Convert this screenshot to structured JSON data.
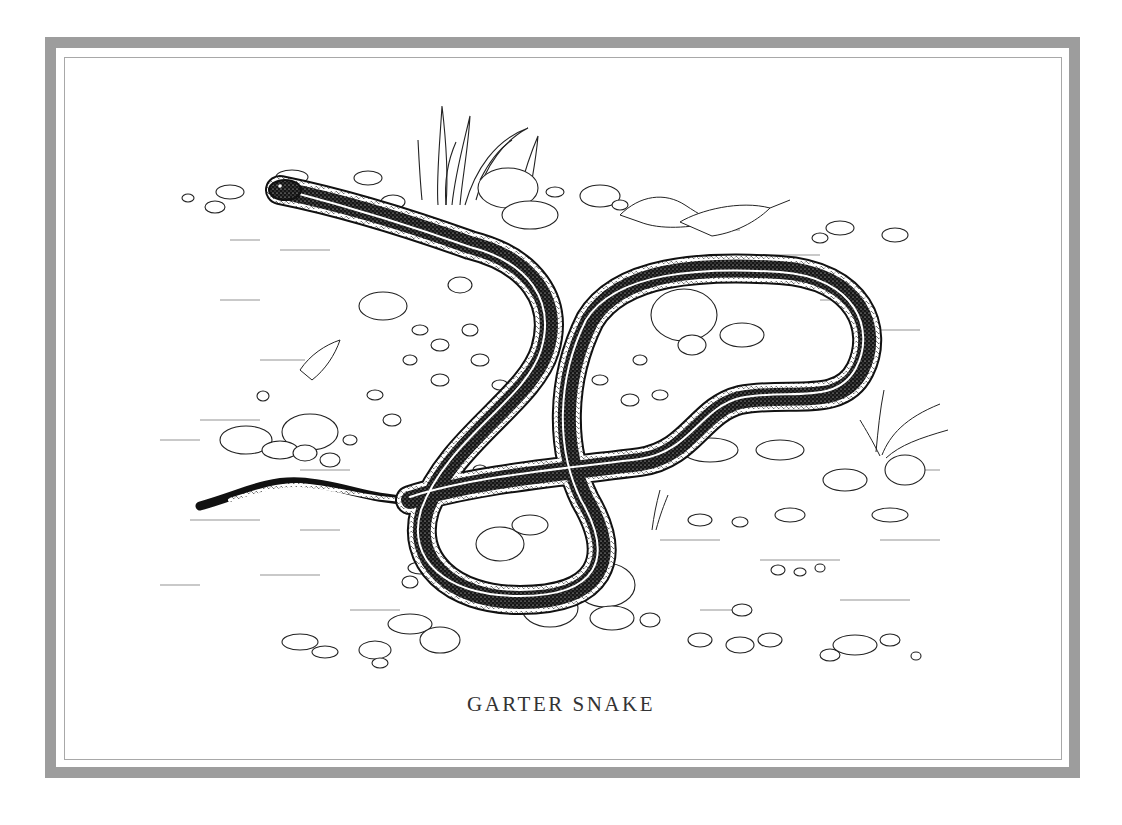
{
  "caption": "GARTER SNAKE",
  "colors": {
    "frame": "#9d9d9d",
    "inner_line": "#a8a8a8",
    "ink": "#111111",
    "paper": "#ffffff",
    "caption": "#333333"
  },
  "illustration": {
    "subject": "garter-snake",
    "style": "pen-and-ink"
  }
}
